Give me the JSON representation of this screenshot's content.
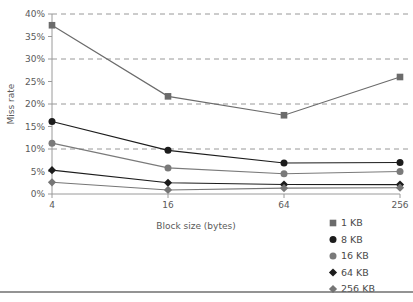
{
  "chart_data": {
    "type": "line",
    "title": "",
    "xlabel": "Block size (bytes)",
    "ylabel": "Miss rate",
    "categories": [
      "4",
      "16",
      "64",
      "256"
    ],
    "xtick_labels": [
      "4",
      "16",
      "64",
      "256"
    ],
    "ytick_labels": [
      "0%",
      "5%",
      "10%",
      "15%",
      "20%",
      "25%",
      "30%",
      "35%",
      "40%"
    ],
    "ytick_values": [
      0,
      5,
      10,
      15,
      20,
      25,
      30,
      35,
      40
    ],
    "ylim": [
      0,
      40
    ],
    "grid": "horizontal-dashed-at-10-20-30-40",
    "gridline_values": [
      10,
      20,
      30,
      40
    ],
    "legend_position": "bottom-right",
    "series": [
      {
        "name": "1 KB",
        "marker": "square",
        "color": "#6b6b6b",
        "values": [
          37.5,
          21.7,
          17.5,
          26.0
        ]
      },
      {
        "name": "8 KB",
        "marker": "circle",
        "color": "#1c1c1c",
        "values": [
          16.1,
          9.7,
          6.9,
          7.0
        ]
      },
      {
        "name": "16 KB",
        "marker": "circle",
        "color": "#7a7a7a",
        "values": [
          11.3,
          5.8,
          4.5,
          5.0
        ]
      },
      {
        "name": "64 KB",
        "marker": "diamond",
        "color": "#1c1c1c",
        "values": [
          5.3,
          2.5,
          2.1,
          2.1
        ]
      },
      {
        "name": "256 KB",
        "marker": "diamond",
        "color": "#767676",
        "values": [
          2.6,
          0.9,
          1.3,
          1.4
        ]
      }
    ]
  },
  "legend": {
    "items": [
      {
        "label": "1 KB"
      },
      {
        "label": "8 KB"
      },
      {
        "label": "16 KB"
      },
      {
        "label": "64 KB"
      },
      {
        "label": "256 KB"
      }
    ]
  }
}
